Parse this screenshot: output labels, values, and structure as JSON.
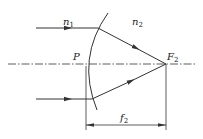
{
  "diagram": {
    "labels": {
      "n1": "n",
      "n1_sub": "1",
      "n2": "n",
      "n2_sub": "2",
      "P": "P",
      "F2": "F",
      "F2_sub": "2",
      "f2": "f",
      "f2_sub": "2"
    },
    "colors": {
      "line": "#333333",
      "background": "#ffffff"
    }
  }
}
